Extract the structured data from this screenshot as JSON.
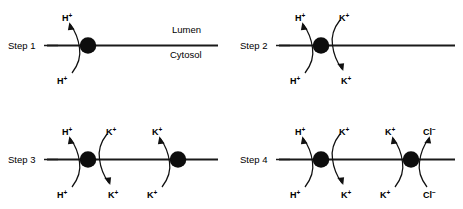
{
  "figure": {
    "compartments": {
      "upper_label": "Lumen",
      "lower_label": "Cytosol"
    },
    "colors": {
      "ink": "#111111",
      "membrane": "#1a1a1a",
      "protein": "#0d0d0d",
      "background": "#ffffff"
    },
    "panels": [
      {
        "id": "step1",
        "label": "Step 1",
        "transporters": [
          {
            "id": "step1-pump",
            "name": "proton-pump",
            "fluxes": [
              {
                "ion": "H",
                "charge": "+",
                "top_label": "H",
                "bottom_label": "H",
                "direction": "upward",
                "side": "left"
              }
            ]
          }
        ]
      },
      {
        "id": "step2",
        "label": "Step 2",
        "transporters": [
          {
            "id": "step2-pump",
            "name": "proton-potassium-exchanger",
            "fluxes": [
              {
                "ion": "H",
                "charge": "+",
                "top_label": "H",
                "bottom_label": "H",
                "direction": "upward",
                "side": "left"
              },
              {
                "ion": "K",
                "charge": "+",
                "top_label": "K",
                "bottom_label": "K",
                "direction": "downward",
                "side": "right"
              }
            ]
          }
        ]
      },
      {
        "id": "step3",
        "label": "Step 3",
        "transporters": [
          {
            "id": "step3-pump",
            "name": "proton-potassium-exchanger",
            "fluxes": [
              {
                "ion": "H",
                "charge": "+",
                "top_label": "H",
                "bottom_label": "H",
                "direction": "upward",
                "side": "left"
              },
              {
                "ion": "K",
                "charge": "+",
                "top_label": "K",
                "bottom_label": "K",
                "direction": "downward",
                "side": "right"
              }
            ]
          },
          {
            "id": "step3-channel",
            "name": "potassium-channel",
            "fluxes": [
              {
                "ion": "K",
                "charge": "+",
                "top_label": "K",
                "bottom_label": "K",
                "direction": "upward",
                "side": "left"
              }
            ]
          }
        ]
      },
      {
        "id": "step4",
        "label": "Step 4",
        "transporters": [
          {
            "id": "step4-pump",
            "name": "proton-potassium-exchanger",
            "fluxes": [
              {
                "ion": "H",
                "charge": "+",
                "top_label": "H",
                "bottom_label": "H",
                "direction": "upward",
                "side": "left"
              },
              {
                "ion": "K",
                "charge": "+",
                "top_label": "K",
                "bottom_label": "K",
                "direction": "downward",
                "side": "right"
              }
            ]
          },
          {
            "id": "step4-channel",
            "name": "potassium-chloride-channel",
            "fluxes": [
              {
                "ion": "K",
                "charge": "+",
                "top_label": "K",
                "bottom_label": "K",
                "direction": "upward",
                "side": "left"
              },
              {
                "ion": "Cl",
                "charge": "−",
                "top_label": "Cl",
                "bottom_label": "Cl",
                "direction": "upward",
                "side": "right"
              }
            ]
          }
        ]
      }
    ],
    "ions": {
      "hydrogen": {
        "symbol": "H",
        "charge": "+"
      },
      "potassium": {
        "symbol": "K",
        "charge": "+"
      },
      "chloride": {
        "symbol": "Cl",
        "charge": "−"
      }
    }
  }
}
